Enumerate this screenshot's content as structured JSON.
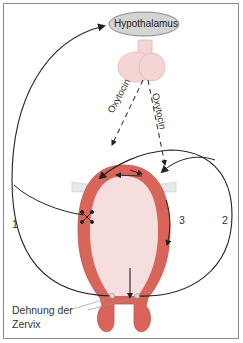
{
  "diagram": {
    "title_node": "Hypothalamus",
    "hormone_labels": [
      "Oxytocin",
      "Oxytocin"
    ],
    "pathway_labels": [
      "1",
      "2",
      "3"
    ],
    "annotation": {
      "line1": "Dehnung der",
      "line2": "Zervix"
    },
    "colors": {
      "uterus_wall": "#d9645a",
      "uterus_inner": "#f7dede",
      "pituitary": "#f5d5d3",
      "hypothalamus_fill": "#d4d4d4",
      "ligament": "#e4e8ea",
      "frame": "#8a8a8a",
      "lines": "#222222"
    }
  }
}
